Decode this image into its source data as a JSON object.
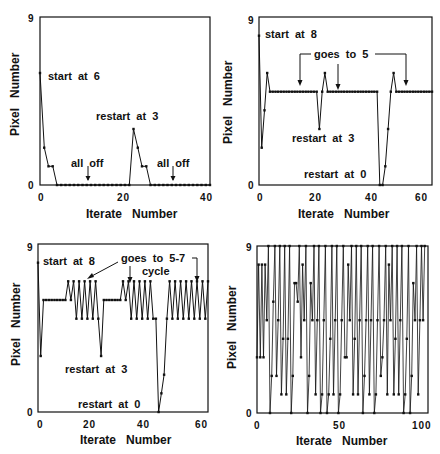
{
  "chart_data": [
    {
      "type": "line",
      "panel": "top-left",
      "xlabel": "Iterate   Number",
      "ylabel": "Pixel   Number",
      "xlim": [
        0,
        40
      ],
      "ylim": [
        0,
        9
      ],
      "xticks": [
        "0",
        "20",
        "40"
      ],
      "yticks": [
        "0",
        "9"
      ],
      "grid": false,
      "x": [
        0,
        1,
        2,
        3,
        4,
        5,
        6,
        7,
        8,
        9,
        10,
        11,
        12,
        13,
        14,
        15,
        16,
        17,
        18,
        19,
        20,
        21,
        22,
        23,
        24,
        25,
        26,
        27,
        28,
        29,
        30,
        31,
        32,
        33,
        34,
        35,
        36,
        37,
        38,
        39,
        40
      ],
      "values": [
        6,
        2,
        1,
        1,
        0,
        0,
        0,
        0,
        0,
        0,
        0,
        0,
        0,
        0,
        0,
        0,
        0,
        0,
        0,
        0,
        0,
        0,
        3,
        2,
        1,
        1,
        0,
        0,
        0,
        0,
        0,
        0,
        0,
        0,
        0,
        0,
        0,
        0,
        0,
        0,
        0
      ],
      "annotations": [
        {
          "text": "start  at  6",
          "x": 1.5,
          "y": 6.2
        },
        {
          "text": "restart  at  3",
          "x": 13,
          "y": 3.8
        },
        {
          "text": "all  off",
          "x": 7,
          "y": 1.3,
          "arrow_x": 11.5
        },
        {
          "text": "all  off",
          "x": 27,
          "y": 1.3,
          "arrow_x": 31.5
        }
      ]
    },
    {
      "type": "line",
      "panel": "top-right",
      "xlabel": "Iterate   Number",
      "ylabel": "Pixel   Number",
      "xlim": [
        0,
        63
      ],
      "ylim": [
        0,
        9
      ],
      "xticks": [
        "0",
        "20",
        "40",
        "60"
      ],
      "yticks": [
        "0",
        "9"
      ],
      "grid": false,
      "x": [
        0,
        1,
        2,
        3,
        4,
        5,
        6,
        7,
        8,
        9,
        10,
        11,
        12,
        13,
        14,
        15,
        16,
        17,
        18,
        19,
        20,
        21,
        22,
        23,
        24,
        25,
        26,
        27,
        28,
        29,
        30,
        31,
        32,
        33,
        34,
        35,
        36,
        37,
        38,
        39,
        40,
        41,
        42,
        43,
        44,
        45,
        46,
        47,
        48,
        49,
        50,
        51,
        52,
        53,
        54,
        55,
        56,
        57,
        58,
        59,
        60,
        61,
        62,
        63
      ],
      "values": [
        8,
        2,
        4,
        6,
        5,
        5,
        5,
        5,
        5,
        5,
        5,
        5,
        5,
        5,
        5,
        5,
        5,
        5,
        5,
        5,
        5,
        5,
        3,
        5,
        6,
        5,
        5,
        5,
        5,
        5,
        5,
        5,
        5,
        5,
        5,
        5,
        5,
        5,
        5,
        5,
        5,
        5,
        5,
        5,
        0,
        0,
        1,
        3,
        5,
        6,
        5,
        5,
        5,
        5,
        5,
        5,
        5,
        5,
        5,
        5,
        5,
        5,
        5,
        5
      ],
      "annotations": [
        {
          "text": "start  at  8",
          "x": 1.5,
          "y": 8.2
        },
        {
          "text": "goes  to  5",
          "x": 20,
          "y": 7.1,
          "arrows_x": [
            15,
            29,
            54
          ]
        },
        {
          "text": "restart  at  3",
          "x": 12,
          "y": 2.7
        },
        {
          "text": "restart  at  0",
          "x": 16,
          "y": 0.6
        }
      ]
    },
    {
      "type": "line",
      "panel": "bottom-left",
      "xlabel": "Iterate   Number",
      "ylabel": "Pixel   Number",
      "xlim": [
        0,
        62
      ],
      "ylim": [
        0,
        9
      ],
      "xticks": [
        "0",
        "20",
        "40",
        "60"
      ],
      "yticks": [
        "0",
        "9"
      ],
      "grid": false,
      "x": [
        0,
        1,
        2,
        3,
        4,
        5,
        6,
        7,
        8,
        9,
        10,
        11,
        12,
        13,
        14,
        15,
        16,
        17,
        18,
        19,
        20,
        21,
        22,
        23,
        24,
        25,
        26,
        27,
        28,
        29,
        30,
        31,
        32,
        33,
        34,
        35,
        36,
        37,
        38,
        39,
        40,
        41,
        42,
        43,
        44,
        45,
        46,
        47,
        48,
        49,
        50,
        51,
        52,
        53,
        54,
        55,
        56,
        57,
        58,
        59,
        60,
        61,
        62
      ],
      "values": [
        8,
        3,
        6,
        6,
        6,
        6,
        6,
        6,
        6,
        6,
        6,
        7,
        6,
        7,
        5,
        7,
        5,
        7,
        5,
        7,
        5,
        7,
        5,
        3,
        6,
        6,
        6,
        6,
        6,
        6,
        6,
        7,
        6,
        7,
        5,
        7,
        5,
        7,
        5,
        7,
        5,
        7,
        5,
        5,
        0,
        1,
        2,
        5,
        7,
        5,
        7,
        5,
        7,
        5,
        7,
        5,
        7,
        5,
        7,
        5,
        7,
        5,
        7
      ],
      "annotations": [
        {
          "text": "start  at  8",
          "x": 1.5,
          "y": 8.2
        },
        {
          "text": "goes  to  5-7",
          "x": 30,
          "y": 8.1
        },
        {
          "text": "cycle",
          "x": 37,
          "y": 7.6,
          "arrows_x": [
            18,
            36,
            58
          ]
        },
        {
          "text": "restart  at  3",
          "x": 10,
          "y": 2.4
        },
        {
          "text": "restart  at  0",
          "x": 16,
          "y": 0.4
        }
      ]
    },
    {
      "type": "line",
      "panel": "bottom-right",
      "xlabel": "Iterate   Number",
      "ylabel": "Pixel   Number",
      "xlim": [
        0,
        105
      ],
      "ylim": [
        0,
        9
      ],
      "xticks": [
        "0",
        "50",
        "100"
      ],
      "yticks": [
        "0",
        "9"
      ],
      "grid": false,
      "x": [
        0,
        1,
        2,
        3,
        4,
        5,
        6,
        7,
        8,
        9,
        10,
        11,
        12,
        13,
        14,
        15,
        16,
        17,
        18,
        19,
        20,
        21,
        22,
        23,
        24,
        25,
        26,
        27,
        28,
        29,
        30,
        31,
        32,
        33,
        34,
        35,
        36,
        37,
        38,
        39,
        40,
        41,
        42,
        43,
        44,
        45,
        46,
        47,
        48,
        49,
        50,
        51,
        52,
        53,
        54,
        55,
        56,
        57,
        58,
        59,
        60,
        61,
        62,
        63,
        64,
        65,
        66,
        67,
        68,
        69,
        70,
        71,
        72,
        73,
        74,
        75,
        76,
        77,
        78,
        79,
        80,
        81,
        82,
        83,
        84,
        85,
        86,
        87,
        88,
        89,
        90,
        91,
        92,
        93,
        94,
        95,
        96,
        97,
        98,
        99,
        100,
        101,
        102,
        103
      ],
      "values": [
        3,
        8,
        3,
        8,
        3,
        8,
        5,
        9,
        0,
        2,
        6,
        9,
        2,
        5,
        9,
        1,
        4,
        9,
        1,
        4,
        9,
        0,
        2,
        7,
        7,
        6,
        9,
        3,
        8,
        5,
        9,
        0,
        2,
        7,
        5,
        9,
        1,
        5,
        9,
        0,
        1,
        5,
        9,
        0,
        1,
        4,
        9,
        1,
        5,
        9,
        0,
        1,
        5,
        9,
        3,
        3,
        8,
        5,
        9,
        1,
        4,
        9,
        1,
        5,
        9,
        0,
        2,
        5,
        9,
        1,
        5,
        9,
        0,
        1,
        5,
        9,
        2,
        3,
        5,
        9,
        1,
        8,
        5,
        9,
        1,
        4,
        9,
        1,
        5,
        9,
        0,
        1,
        4,
        9,
        0,
        2,
        7,
        5,
        9,
        1,
        5,
        9,
        5,
        9
      ],
      "annotations": []
    }
  ],
  "panels": [
    {
      "ylabel": "Pixel   Number",
      "xlabel": "Iterate   Number",
      "ytick_top": "9",
      "ytick_bottom": "0",
      "xticks": [
        "0",
        "20",
        "40"
      ],
      "notes": [
        "start  at  6",
        "restart  at  3",
        "all  off",
        "all  off"
      ]
    },
    {
      "ylabel": "Pixel   Number",
      "xlabel": "Iterate   Number",
      "ytick_top": "9",
      "ytick_bottom": "0",
      "xticks": [
        "0",
        "20",
        "40",
        "60"
      ],
      "notes": [
        "start  at  8",
        "goes  to  5",
        "restart  at  3",
        "restart  at  0"
      ]
    },
    {
      "ylabel": "Pixel   Number",
      "xlabel": "Iterate   Number",
      "ytick_top": "9",
      "ytick_bottom": "0",
      "xticks": [
        "0",
        "20",
        "40",
        "60"
      ],
      "notes": [
        "start  at  8",
        "goes  to  5-7",
        "cycle",
        "restart  at  3",
        "restart  at  0"
      ]
    },
    {
      "ylabel": "Pixel   Number",
      "xlabel": "Iterate   Number",
      "ytick_top": "9",
      "ytick_bottom": "0",
      "xticks": [
        "0",
        "50",
        "100"
      ],
      "notes": []
    }
  ],
  "colors": {
    "ink": "#111111",
    "background": "#ffffff"
  }
}
